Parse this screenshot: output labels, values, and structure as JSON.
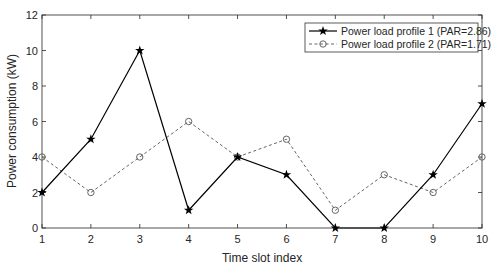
{
  "chart_data": {
    "type": "line",
    "title": "",
    "xlabel": "Time slot index",
    "ylabel": "Power consumption (kW)",
    "x": [
      1,
      2,
      3,
      4,
      5,
      6,
      7,
      8,
      9,
      10
    ],
    "xlim": [
      1,
      10
    ],
    "ylim": [
      0,
      12
    ],
    "xticks": [
      "1",
      "2",
      "3",
      "4",
      "5",
      "6",
      "7",
      "8",
      "9",
      "10"
    ],
    "yticks": [
      "0",
      "2",
      "4",
      "6",
      "8",
      "10",
      "12"
    ],
    "grid": false,
    "legend_position": "upper right",
    "series": [
      {
        "name": "Power load profile 1 (PAR=2.86)",
        "values": [
          2,
          5,
          10,
          1,
          4,
          3,
          0,
          0,
          3,
          7
        ],
        "line": "solid",
        "marker": "star",
        "color": "#000000"
      },
      {
        "name": "Power load profile 2 (PAR=1.71)",
        "values": [
          4,
          2,
          4,
          6,
          4,
          5,
          1,
          3,
          2,
          4
        ],
        "line": "dashed",
        "marker": "circle",
        "color": "#555555"
      }
    ]
  }
}
